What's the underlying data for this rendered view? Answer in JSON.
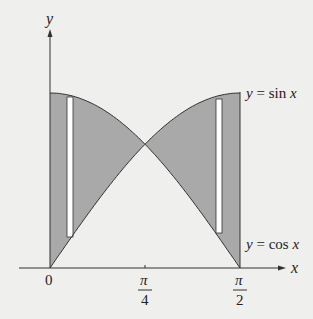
{
  "figure": {
    "axes": {
      "x_label": "x",
      "y_label": "y",
      "ticks": [
        {
          "label": "0",
          "value": 0
        },
        {
          "numerator": "π",
          "denominator": "4",
          "value": 0.7853981634
        },
        {
          "numerator": "π",
          "denominator": "2",
          "value": 1.5707963268
        }
      ]
    },
    "curves": [
      {
        "name": "sine",
        "label": "y = sin x"
      },
      {
        "name": "cosine",
        "label": "y = cos x"
      }
    ],
    "shaded_regions": [
      {
        "name": "left-region",
        "between": "cos x and sin x",
        "interval": "0 to π/4"
      },
      {
        "name": "right-region",
        "between": "sin x and cos x",
        "interval": "π/4 to π/2"
      }
    ],
    "representative_strips": [
      {
        "name": "left-strip",
        "position": "near x = 0"
      },
      {
        "name": "right-strip",
        "position": "near x = π/2"
      }
    ],
    "colors": {
      "background": "#efefed",
      "shade": "#a9a9a9",
      "strip": "#ffffff",
      "line": "#333333"
    }
  }
}
